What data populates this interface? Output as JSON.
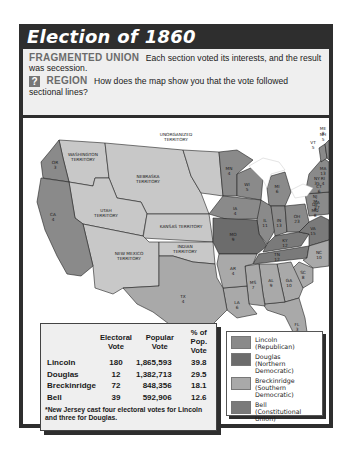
{
  "title": "Election of 1860",
  "intro": {
    "kicker": "FRAGMENTED UNION",
    "text": "Each section voted its interests, and the result was secession.",
    "question_icon": "question-mark-icon",
    "question_kicker": "REGION",
    "question_text": "How does the map show you that the vote followed sectional lines?"
  },
  "colors": {
    "lincoln": "#8a8a8a",
    "douglas": "#6c6c6c",
    "breckinridge": "#a9a9a9",
    "bell": "#7a7a7a",
    "territory": "#c8c8c8",
    "water": "#ffffff"
  },
  "map": {
    "territories": [
      {
        "name": "UNORGANIZED TERRITORY"
      },
      {
        "name": "WASHINGTON TERRITORY"
      },
      {
        "name": "NEBRASKA TERRITORY"
      },
      {
        "name": "UTAH TERRITORY"
      },
      {
        "name": "KANSAS TERRITORY"
      },
      {
        "name": "NEW MEXICO TERRITORY"
      },
      {
        "name": "INDIAN TERRITORY"
      }
    ],
    "states": [
      {
        "abbr": "OR",
        "ev": "3",
        "winner": "lincoln"
      },
      {
        "abbr": "CA",
        "ev": "4",
        "winner": "lincoln"
      },
      {
        "abbr": "MN",
        "ev": "4",
        "winner": "lincoln"
      },
      {
        "abbr": "WI",
        "ev": "5",
        "winner": "lincoln"
      },
      {
        "abbr": "MI",
        "ev": "6",
        "winner": "lincoln"
      },
      {
        "abbr": "IA",
        "ev": "4",
        "winner": "lincoln"
      },
      {
        "abbr": "IL",
        "ev": "11",
        "winner": "lincoln"
      },
      {
        "abbr": "IN",
        "ev": "13",
        "winner": "lincoln"
      },
      {
        "abbr": "OH",
        "ev": "23",
        "winner": "lincoln"
      },
      {
        "abbr": "PA",
        "ev": "27",
        "winner": "lincoln"
      },
      {
        "abbr": "NY",
        "ev": "35",
        "winner": "lincoln"
      },
      {
        "abbr": "VT",
        "ev": "5",
        "winner": "lincoln"
      },
      {
        "abbr": "NH",
        "ev": "5",
        "winner": "lincoln"
      },
      {
        "abbr": "ME",
        "ev": "8",
        "winner": "lincoln"
      },
      {
        "abbr": "MA",
        "ev": "13",
        "winner": "lincoln"
      },
      {
        "abbr": "RI",
        "ev": "4",
        "winner": "lincoln"
      },
      {
        "abbr": "CT",
        "ev": "6",
        "winner": "lincoln"
      },
      {
        "abbr": "NJ",
        "ev": "7*",
        "winner": "lincoln"
      },
      {
        "abbr": "MO",
        "ev": "9",
        "winner": "douglas"
      },
      {
        "abbr": "KY",
        "ev": "12",
        "winner": "bell"
      },
      {
        "abbr": "TN",
        "ev": "12",
        "winner": "bell"
      },
      {
        "abbr": "VA",
        "ev": "15",
        "winner": "bell"
      },
      {
        "abbr": "DE",
        "ev": "3",
        "winner": "breckinridge"
      },
      {
        "abbr": "MD",
        "ev": "8",
        "winner": "breckinridge"
      },
      {
        "abbr": "NC",
        "ev": "10",
        "winner": "breckinridge"
      },
      {
        "abbr": "SC",
        "ev": "8",
        "winner": "breckinridge"
      },
      {
        "abbr": "GA",
        "ev": "10",
        "winner": "breckinridge"
      },
      {
        "abbr": "FL",
        "ev": "3",
        "winner": "breckinridge"
      },
      {
        "abbr": "AL",
        "ev": "9",
        "winner": "breckinridge"
      },
      {
        "abbr": "MS",
        "ev": "7",
        "winner": "breckinridge"
      },
      {
        "abbr": "LA",
        "ev": "6",
        "winner": "breckinridge"
      },
      {
        "abbr": "AR",
        "ev": "4",
        "winner": "breckinridge"
      },
      {
        "abbr": "TX",
        "ev": "4",
        "winner": "breckinridge"
      }
    ]
  },
  "results_table": {
    "headers": [
      "",
      "Electoral Vote",
      "Popular Vote",
      "% of Pop. Vote"
    ],
    "header_lines": [
      [
        "",
        ""
      ],
      [
        "Electoral",
        "Vote"
      ],
      [
        "Popular",
        "Vote"
      ],
      [
        "% of",
        "Pop. Vote"
      ]
    ],
    "rows": [
      {
        "candidate": "Lincoln",
        "electoral": "180",
        "popular": "1,865,593",
        "percent": "39.8"
      },
      {
        "candidate": "Douglas",
        "electoral": "12",
        "popular": "1,382,713",
        "percent": "29.5"
      },
      {
        "candidate": "Breckinridge",
        "electoral": "72",
        "popular": "848,356",
        "percent": "18.1"
      },
      {
        "candidate": "Bell",
        "electoral": "39",
        "popular": "592,906",
        "percent": "12.6"
      }
    ],
    "footnote": "*New Jersey cast four electoral votes for Lincoln and three for Douglas."
  },
  "legend": {
    "items": [
      {
        "key": "lincoln",
        "name": "Lincoln",
        "party": "(Republican)"
      },
      {
        "key": "douglas",
        "name": "Douglas",
        "party": "(Northern Democratic)"
      },
      {
        "key": "breckinridge",
        "name": "Breckinridge",
        "party": "(Southern Democratic)"
      },
      {
        "key": "bell",
        "name": "Bell",
        "party": "(Constitutional Union)"
      }
    ]
  }
}
